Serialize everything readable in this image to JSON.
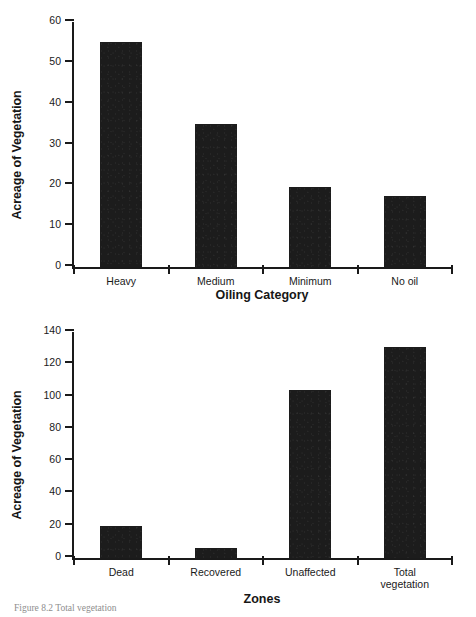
{
  "page": {
    "caption": "Figure 8.2 Total vegetation"
  },
  "chart_data": [
    {
      "id": "top",
      "type": "bar",
      "title": "",
      "xlabel": "Oiling Category",
      "ylabel": "Acreage of Vegetation",
      "categories": [
        "Heavy",
        "Medium",
        "Minimum",
        "No oil"
      ],
      "values": [
        55,
        35,
        19.7,
        17.5
      ],
      "ylim": [
        0,
        60
      ],
      "yticks": [
        0,
        10,
        20,
        30,
        40,
        50,
        60
      ],
      "grid": false,
      "legend": false,
      "bar_color": "#1c1c1c"
    },
    {
      "id": "bottom",
      "type": "bar",
      "title": "",
      "xlabel": "Zones",
      "ylabel": "Acreage of Vegetation",
      "categories": [
        "Dead",
        "Recovered",
        "Unaffected",
        "Total\nvegetation"
      ],
      "values": [
        20,
        6.5,
        104,
        130.5
      ],
      "ylim": [
        0,
        140
      ],
      "yticks": [
        0,
        20,
        40,
        60,
        80,
        100,
        120,
        140
      ],
      "grid": false,
      "legend": false,
      "bar_color": "#1c1c1c"
    }
  ]
}
